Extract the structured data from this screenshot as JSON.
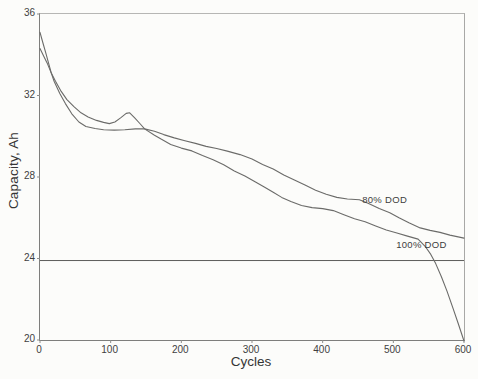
{
  "figure": {
    "background": "#fcfcfa",
    "frame_color": "#8e8e8c",
    "text_color": "#3d3d3d"
  },
  "chart_data": {
    "type": "line",
    "title": "",
    "xlabel": "Cycles",
    "ylabel": "Capacity, Ah",
    "xlim": [
      0,
      600
    ],
    "ylim": [
      20,
      36
    ],
    "xticks": [
      "0",
      "100",
      "200",
      "300",
      "400",
      "500",
      "600"
    ],
    "xtick_values": [
      0,
      100,
      200,
      300,
      400,
      500,
      600
    ],
    "yticks": [
      "20",
      "24",
      "28",
      "32",
      "36"
    ],
    "ytick_values": [
      20,
      24,
      28,
      32,
      36
    ],
    "grid": false,
    "legend_position": "inline-annotations",
    "line_color": "#6b6b69",
    "reference_line": {
      "y": 23.9,
      "color": "#5c5c5a"
    },
    "series": [
      {
        "name": "80% DOD",
        "points": [
          [
            0,
            35.1
          ],
          [
            4,
            34.6
          ],
          [
            8,
            34.1
          ],
          [
            12,
            33.6
          ],
          [
            16,
            33.1
          ],
          [
            20,
            32.7
          ],
          [
            28,
            32.1
          ],
          [
            36,
            31.6
          ],
          [
            45,
            31.1
          ],
          [
            55,
            30.7
          ],
          [
            65,
            30.48
          ],
          [
            78,
            30.38
          ],
          [
            90,
            30.32
          ],
          [
            105,
            30.3
          ],
          [
            120,
            30.32
          ],
          [
            135,
            30.36
          ],
          [
            148,
            30.36
          ],
          [
            162,
            30.25
          ],
          [
            175,
            30.08
          ],
          [
            190,
            29.92
          ],
          [
            205,
            29.78
          ],
          [
            220,
            29.65
          ],
          [
            235,
            29.5
          ],
          [
            250,
            29.4
          ],
          [
            265,
            29.27
          ],
          [
            283,
            29.1
          ],
          [
            300,
            28.88
          ],
          [
            315,
            28.62
          ],
          [
            330,
            28.4
          ],
          [
            345,
            28.1
          ],
          [
            360,
            27.85
          ],
          [
            375,
            27.6
          ],
          [
            390,
            27.35
          ],
          [
            405,
            27.15
          ],
          [
            420,
            27.0
          ],
          [
            435,
            26.92
          ],
          [
            452,
            26.88
          ],
          [
            465,
            26.7
          ],
          [
            480,
            26.45
          ],
          [
            495,
            26.25
          ],
          [
            508,
            26.0
          ],
          [
            522,
            25.75
          ],
          [
            538,
            25.5
          ],
          [
            552,
            25.38
          ],
          [
            566,
            25.28
          ],
          [
            580,
            25.15
          ],
          [
            600,
            25.0
          ]
        ]
      },
      {
        "name": "100% DOD",
        "points": [
          [
            0,
            34.3
          ],
          [
            5,
            33.95
          ],
          [
            10,
            33.6
          ],
          [
            16,
            33.1
          ],
          [
            22,
            32.7
          ],
          [
            30,
            32.2
          ],
          [
            38,
            31.8
          ],
          [
            48,
            31.45
          ],
          [
            58,
            31.15
          ],
          [
            68,
            30.95
          ],
          [
            80,
            30.78
          ],
          [
            90,
            30.68
          ],
          [
            98,
            30.62
          ],
          [
            106,
            30.7
          ],
          [
            114,
            30.9
          ],
          [
            122,
            31.12
          ],
          [
            127,
            31.15
          ],
          [
            134,
            30.9
          ],
          [
            142,
            30.6
          ],
          [
            148,
            30.36
          ],
          [
            162,
            30.05
          ],
          [
            172,
            29.85
          ],
          [
            185,
            29.6
          ],
          [
            200,
            29.42
          ],
          [
            215,
            29.28
          ],
          [
            230,
            29.05
          ],
          [
            245,
            28.85
          ],
          [
            260,
            28.6
          ],
          [
            275,
            28.3
          ],
          [
            290,
            28.05
          ],
          [
            305,
            27.75
          ],
          [
            318,
            27.5
          ],
          [
            330,
            27.25
          ],
          [
            342,
            27.0
          ],
          [
            355,
            26.8
          ],
          [
            370,
            26.6
          ],
          [
            385,
            26.5
          ],
          [
            400,
            26.45
          ],
          [
            415,
            26.35
          ],
          [
            430,
            26.15
          ],
          [
            445,
            25.95
          ],
          [
            460,
            25.8
          ],
          [
            475,
            25.6
          ],
          [
            490,
            25.4
          ],
          [
            505,
            25.25
          ],
          [
            520,
            25.1
          ],
          [
            535,
            24.95
          ],
          [
            545,
            24.6
          ],
          [
            553,
            24.2
          ],
          [
            560,
            23.75
          ],
          [
            568,
            23.1
          ],
          [
            576,
            22.4
          ],
          [
            584,
            21.6
          ],
          [
            592,
            20.8
          ],
          [
            600,
            19.95
          ]
        ]
      }
    ],
    "annotations": [
      {
        "text": "80% DOD",
        "x": 456,
        "y": 26.72
      },
      {
        "text": "100% DOD",
        "x": 504,
        "y": 24.52
      }
    ]
  }
}
